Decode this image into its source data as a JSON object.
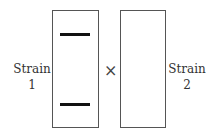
{
  "diagram": {
    "strain1": {
      "label_line1": "Strain",
      "label_line2": "1",
      "bands": 2
    },
    "strain2": {
      "label_line1": "Strain",
      "label_line2": "2",
      "bands": 0
    },
    "operator": "×"
  }
}
